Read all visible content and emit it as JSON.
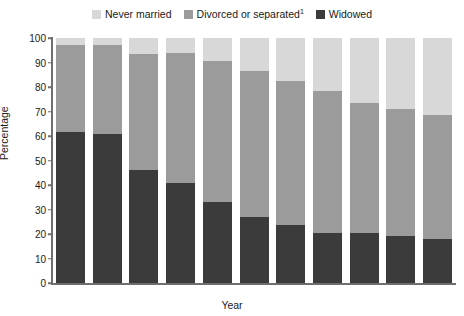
{
  "legend": {
    "position": "top-center",
    "items": [
      {
        "label": "Never married",
        "color": "#d8d8d8",
        "key": "never_married"
      },
      {
        "label": "Divorced or separated",
        "footnote": "1",
        "color": "#9b9b9b",
        "key": "divorced_or_separated"
      },
      {
        "label": "Widowed",
        "color": "#3b3b3b",
        "key": "widowed"
      }
    ]
  },
  "axes": {
    "y": {
      "title": "Percentage",
      "ticks": [
        0,
        10,
        20,
        30,
        40,
        50,
        60,
        70,
        80,
        90,
        100
      ],
      "min": 0,
      "max": 100
    },
    "x": {
      "title": "Year",
      "ticks": [
        "1961",
        "1966",
        "1971",
        "1976",
        "1981",
        "1986",
        "1991",
        "1996",
        "2001",
        "2006",
        "2011"
      ]
    }
  },
  "chart_data": {
    "type": "bar",
    "subtype": "stacked-vertical",
    "title": "",
    "xlabel": "Year",
    "ylabel": "Percentage",
    "ylim": [
      0,
      100
    ],
    "grid": false,
    "legend_position": "top-center",
    "categories": [
      "1961",
      "1966",
      "1971",
      "1976",
      "1981",
      "1986",
      "1991",
      "1996",
      "2001",
      "2006",
      "2011"
    ],
    "series": [
      {
        "name": "Widowed",
        "color": "#3b3b3b",
        "values": [
          61.5,
          61,
          46,
          41,
          33,
          27,
          23.5,
          20.5,
          20.5,
          19,
          18
        ]
      },
      {
        "name": "Divorced or separated",
        "footnote": "1",
        "color": "#9b9b9b",
        "values": [
          35.5,
          36,
          47.5,
          53,
          57.5,
          59.5,
          59,
          58,
          53,
          52,
          50.5
        ]
      },
      {
        "name": "Never married",
        "color": "#d8d8d8",
        "values": [
          3,
          3,
          6.5,
          6,
          9.5,
          13.5,
          17.5,
          21.5,
          26.5,
          29,
          31.5
        ]
      }
    ],
    "cumulative_tops": {
      "widowed": [
        61.5,
        61,
        46,
        41,
        33,
        27,
        23.5,
        20.5,
        20.5,
        19,
        18
      ],
      "plus_divorced": [
        97,
        97,
        93.5,
        94,
        90.5,
        86.5,
        82.5,
        78.5,
        73.5,
        71,
        68.5
      ],
      "total": [
        100,
        100,
        100,
        100,
        100,
        100,
        100,
        100,
        100,
        100,
        100
      ]
    }
  },
  "colors": {
    "never_married": "#d8d8d8",
    "divorced_or_separated": "#9b9b9b",
    "widowed": "#3b3b3b",
    "axis": "#6e6e6e",
    "text": "#1a1a1a",
    "background": "#ffffff"
  }
}
